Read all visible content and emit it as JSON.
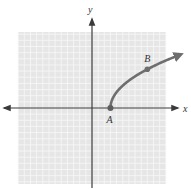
{
  "chart_data": {
    "type": "line",
    "title": "",
    "xlabel": "x",
    "ylabel": "y",
    "grid": true,
    "x_range": [
      -12,
      12
    ],
    "y_range": [
      -12,
      12
    ],
    "series": [
      {
        "name": "curve",
        "shape": "sqrt",
        "start": {
          "x": 3,
          "y": 0
        },
        "end_arrow": true
      }
    ],
    "points": [
      {
        "label": "A",
        "x": 3,
        "y": 0
      },
      {
        "label": "B",
        "x": 9,
        "y": 6.3
      }
    ],
    "colors": {
      "grid_background": "#e6e6e6",
      "grid_line": "#f7f7f7",
      "axis": "#3a3a3a",
      "curve": "#6e6e6e",
      "point": "#5e5e5e"
    }
  }
}
